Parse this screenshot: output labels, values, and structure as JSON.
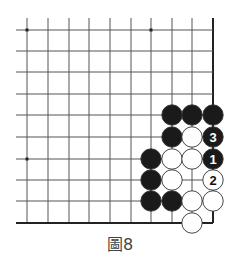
{
  "diagram": {
    "caption": "圖8",
    "colors": {
      "line": "#555555",
      "edge": "#222222",
      "black_stone": "#1a1a1a",
      "white_stone": "#ffffff",
      "stone_outline": "#333333"
    },
    "grid": {
      "cols_x": [
        27,
        48,
        69,
        89,
        110,
        131,
        151,
        172,
        192,
        213
      ],
      "rows_y": [
        30,
        51,
        72,
        94,
        115,
        137,
        159,
        180,
        201,
        223
      ],
      "left_extent": 16,
      "top_extent": 18,
      "right_edge": true,
      "bottom_edge": true
    },
    "hoshi": [
      {
        "col": 0,
        "row": 0
      },
      {
        "col": 6,
        "row": 0
      },
      {
        "col": 0,
        "row": 6
      }
    ],
    "stones": [
      {
        "col": 7,
        "row": 4,
        "color": "black",
        "label": ""
      },
      {
        "col": 8,
        "row": 4,
        "color": "black",
        "label": ""
      },
      {
        "col": 9,
        "row": 4,
        "color": "black",
        "label": ""
      },
      {
        "col": 7,
        "row": 5,
        "color": "black",
        "label": ""
      },
      {
        "col": 8,
        "row": 5,
        "color": "white",
        "label": ""
      },
      {
        "col": 9,
        "row": 5,
        "color": "black",
        "label": "3"
      },
      {
        "col": 6,
        "row": 6,
        "color": "black",
        "label": ""
      },
      {
        "col": 7,
        "row": 6,
        "color": "white",
        "label": ""
      },
      {
        "col": 8,
        "row": 6,
        "color": "white",
        "label": ""
      },
      {
        "col": 9,
        "row": 6,
        "color": "black",
        "label": "1"
      },
      {
        "col": 6,
        "row": 7,
        "color": "black",
        "label": ""
      },
      {
        "col": 7,
        "row": 7,
        "color": "white",
        "label": ""
      },
      {
        "col": 9,
        "row": 7,
        "color": "white",
        "label": "2"
      },
      {
        "col": 6,
        "row": 8,
        "color": "black",
        "label": ""
      },
      {
        "col": 7,
        "row": 8,
        "color": "black",
        "label": ""
      },
      {
        "col": 8,
        "row": 8,
        "color": "white",
        "label": ""
      },
      {
        "col": 9,
        "row": 8,
        "color": "white",
        "label": ""
      },
      {
        "col": 8,
        "row": 9,
        "color": "white",
        "label": ""
      }
    ]
  }
}
